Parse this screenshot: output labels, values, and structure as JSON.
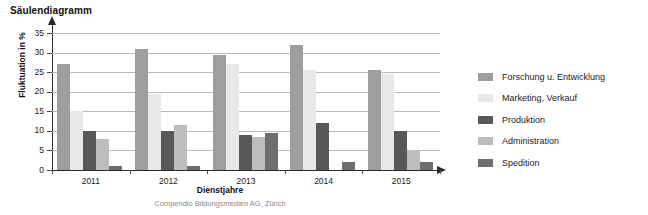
{
  "chart_data": {
    "type": "bar",
    "title": "Säulendiagramm",
    "xlabel": "Dienstjahre",
    "ylabel": "Fluktuation in %",
    "ylim": [
      0,
      35
    ],
    "ytick_step": 5,
    "grid": true,
    "legend_position": "right",
    "categories": [
      "2011",
      "2012",
      "2013",
      "2014",
      "2015"
    ],
    "yticks": [
      "0",
      "5",
      "10",
      "15",
      "20",
      "25",
      "30",
      "35"
    ],
    "series": [
      {
        "name": "Forschung u. Entwicklung",
        "color": "#9e9e9e",
        "values": [
          27,
          31,
          29.5,
          32,
          25.5
        ]
      },
      {
        "name": "Marketing, Verkauf",
        "color": "#e8e8e8",
        "values": [
          15,
          19.5,
          27,
          25.5,
          24.5
        ]
      },
      {
        "name": "Produktion",
        "color": "#585858",
        "values": [
          10,
          10,
          9,
          12,
          10
        ]
      },
      {
        "name": "Administration",
        "color": "#bdbdbd",
        "values": [
          8,
          11.5,
          8.5,
          0,
          5
        ]
      },
      {
        "name": "Spedition",
        "color": "#6f6f6f",
        "values": [
          1,
          1,
          9.5,
          2,
          2
        ]
      }
    ],
    "annotations": {
      "credit": "Compendio Bildungsmedien AG, Zürich"
    }
  }
}
